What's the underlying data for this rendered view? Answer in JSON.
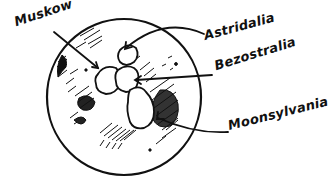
{
  "diagram": {
    "type": "illustrated map",
    "subject": "moon",
    "labels": [
      {
        "text": "Muskow",
        "x": 17,
        "y": 10,
        "size": 13,
        "rotate": -18
      },
      {
        "text": "Astridalia",
        "x": 206,
        "y": 28,
        "size": 13,
        "rotate": -15
      },
      {
        "text": "Bezostralia",
        "x": 217,
        "y": 56,
        "size": 13,
        "rotate": -17
      },
      {
        "text": "Moonsylvania",
        "x": 229,
        "y": 107,
        "size": 13,
        "rotate": -14
      }
    ],
    "colors": {
      "ink": "#111111",
      "background": "#ffffff"
    }
  }
}
